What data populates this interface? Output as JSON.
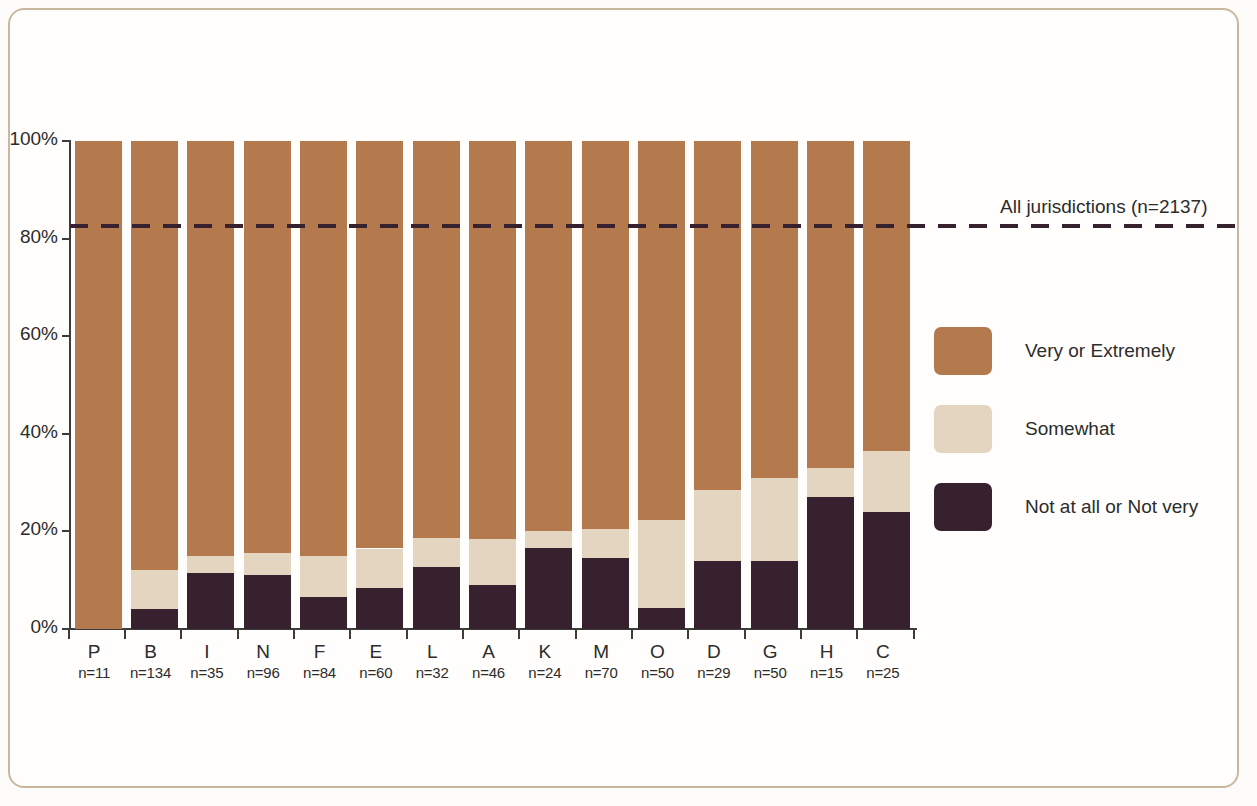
{
  "annotation": {
    "reference_line_label": "All jurisdictions (n=2137)"
  },
  "legend": {
    "items": [
      {
        "label": "Very or Extremely",
        "color": "#b5794e",
        "key": "very_or_extremely"
      },
      {
        "label": "Somewhat",
        "color": "#e3d5c0",
        "key": "somewhat"
      },
      {
        "label": "Not at all or Not very",
        "color": "#38212f",
        "key": "not_at_all_or_not_very"
      }
    ]
  },
  "chart_data": {
    "type": "bar",
    "subtype": "stacked-100-percent",
    "title": "",
    "xlabel": "",
    "ylabel": "",
    "ylim": [
      0,
      100
    ],
    "yticks": [
      "0%",
      "20%",
      "40%",
      "60%",
      "80%",
      "100%"
    ],
    "ytick_values": [
      0,
      20,
      40,
      60,
      80,
      100
    ],
    "grid": false,
    "legend_position": "right",
    "categories": [
      "P",
      "B",
      "I",
      "N",
      "F",
      "E",
      "L",
      "A",
      "K",
      "M",
      "O",
      "D",
      "G",
      "H",
      "C"
    ],
    "category_counts": [
      "n=11",
      "n=134",
      "n=35",
      "n=96",
      "n=84",
      "n=60",
      "n=32",
      "n=46",
      "n=24",
      "n=70",
      "n=50",
      "n=29",
      "n=50",
      "n=15",
      "n=25"
    ],
    "series": [
      {
        "name": "Not at all or Not very",
        "color": "#38212f",
        "values": [
          0,
          4,
          11.5,
          11,
          6.5,
          8.5,
          12.7,
          9,
          16.5,
          14.5,
          4.3,
          14,
          14,
          27,
          24
        ]
      },
      {
        "name": "Somewhat",
        "color": "#e3d5c0",
        "values": [
          0,
          8,
          3.5,
          4.5,
          8.5,
          8,
          6,
          9.5,
          3.5,
          6,
          18,
          14.5,
          17,
          6,
          12.5
        ]
      },
      {
        "name": "Very or Extremely",
        "color": "#b5794e",
        "values": [
          100,
          88,
          85,
          84.5,
          85,
          83.5,
          81.3,
          81.5,
          80,
          79.5,
          77.7,
          71.5,
          69,
          67,
          63.5
        ]
      }
    ],
    "reference_line": {
      "label": "All jurisdictions (n=2137)",
      "value": 82.5,
      "style": "dashed",
      "color": "#38212f"
    }
  }
}
